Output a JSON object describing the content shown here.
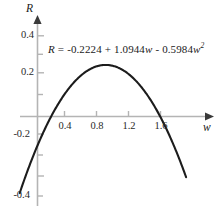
{
  "chart_data": {
    "type": "line",
    "title": "",
    "subtitle": "",
    "xlabel": "w",
    "ylabel": "R",
    "annotation": "R = -0.2224 + 1.0944w - 0.5984w^2",
    "equation": {
      "lhs": "R",
      "equals": "=",
      "c0": "-0.2224",
      "plus": "+",
      "c1": "1.0944",
      "c1_var": "w",
      "minus": "-",
      "c2": "0.5984",
      "c2_var": "w",
      "c2_exp": "2"
    },
    "coefficients": {
      "a": -0.5984,
      "b": 1.0944,
      "c": -0.2224
    },
    "xlim": [
      -0.16,
      1.92
    ],
    "ylim": [
      -0.47,
      0.47
    ],
    "xticks": [
      0.4,
      0.8,
      1.2,
      1.6
    ],
    "xtick_labels": [
      "0.4",
      "0.8",
      "1.2",
      "1.6"
    ],
    "yticks": [
      -0.4,
      -0.2,
      0.2,
      0.4
    ],
    "ytick_labels": [
      "-0.4",
      "-0.2",
      "0.2",
      "0.4"
    ],
    "grid": false,
    "legend": false,
    "axis_arrows": true,
    "vertex": {
      "w": 0.9144,
      "R": 0.2778
    },
    "roots": [
      0.2422,
      1.5867
    ],
    "x": [
      0.0,
      0.1,
      0.2,
      0.3,
      0.4,
      0.5,
      0.6,
      0.7,
      0.8,
      0.9,
      1.0,
      1.1,
      1.2,
      1.3,
      1.4,
      1.5,
      1.6,
      1.7,
      1.8,
      1.9
    ],
    "y": [
      -0.2224,
      -0.119,
      -0.0276,
      0.0519,
      0.1194,
      0.1749,
      0.2185,
      0.2501,
      0.2697,
      0.2774,
      0.2732,
      0.2569,
      0.2287,
      0.1886,
      0.1365,
      0.0724,
      -0.0037,
      -0.0918,
      -0.1919,
      -0.3039
    ],
    "curve_color": "#1c1c1c",
    "axis_color": "#b0b0b0",
    "tick_color": "#b0b0b0",
    "background": "#ffffff"
  }
}
